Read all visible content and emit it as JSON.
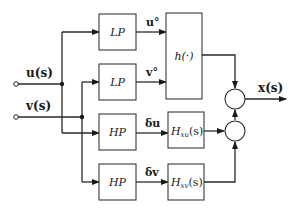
{
  "diagram": {
    "inputs": {
      "u": "u(s)",
      "v": "v(s)"
    },
    "output": "x(s)",
    "blocks": {
      "lp_u": "LP",
      "lp_v": "LP",
      "hp_u": "HP",
      "hp_v": "HP",
      "h": "h(·)",
      "hxu_main": "H",
      "hxu_sub": "xu",
      "hxu_arg": "(s)",
      "hxv_main": "H",
      "hxv_sub": "xv",
      "hxv_arg": "(s)"
    },
    "signals": {
      "u_steady": "u°",
      "v_steady": "v°",
      "delta_u": "δu",
      "delta_v": "δv"
    },
    "colors": {
      "line": "#2a2a2a",
      "background": "#ffffff"
    }
  }
}
